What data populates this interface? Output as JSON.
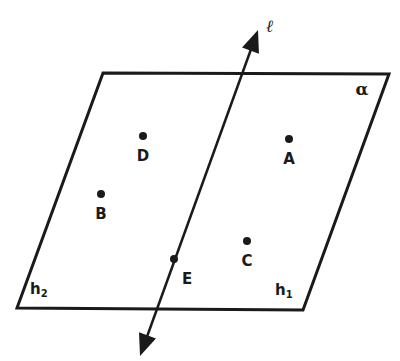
{
  "diagram": {
    "type": "geometry-plane-and-line",
    "plane": {
      "label": "α",
      "corners": [
        [
          103,
          73
        ],
        [
          389,
          74
        ],
        [
          303,
          310
        ],
        [
          17,
          308
        ]
      ],
      "label_pos": [
        362,
        95
      ]
    },
    "line": {
      "label": "ℓ",
      "start": [
        140,
        356
      ],
      "end": [
        258,
        30
      ],
      "label_pos": [
        270,
        32
      ]
    },
    "half_planes": [
      {
        "name": "h",
        "sub": "2",
        "pos": [
          30,
          294
        ]
      },
      {
        "name": "h",
        "sub": "1",
        "pos": [
          275,
          295
        ]
      }
    ],
    "points": [
      {
        "label": "A",
        "x": 289,
        "y": 139,
        "lx": 289,
        "ly": 164
      },
      {
        "label": "B",
        "x": 101,
        "y": 194,
        "lx": 101,
        "ly": 219
      },
      {
        "label": "C",
        "x": 247,
        "y": 241,
        "lx": 247,
        "ly": 266
      },
      {
        "label": "D",
        "x": 143,
        "y": 136,
        "lx": 143,
        "ly": 161
      },
      {
        "label": "E",
        "x": 174,
        "y": 259,
        "lx": 187,
        "ly": 284
      }
    ],
    "stroke_color": "#1a1a1a"
  }
}
